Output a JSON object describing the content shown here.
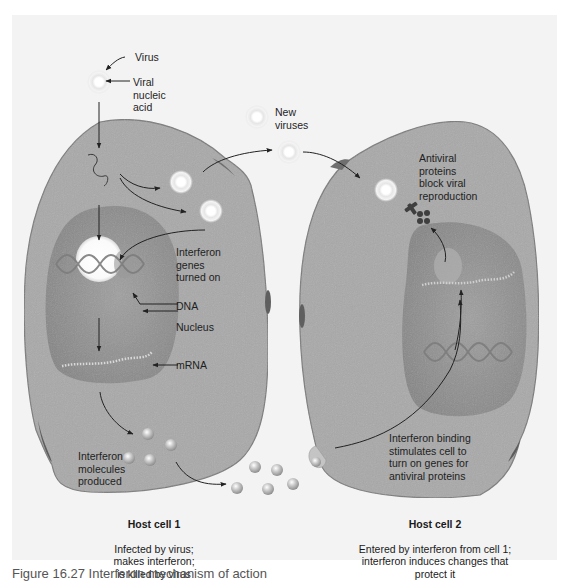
{
  "figure": {
    "background": "#f3f3f3",
    "colors": {
      "cytoplasm": "#a9a9a9",
      "cell_outline": "#7a7a7a",
      "nucleus": "#8b8b8b",
      "highlight": "#ffffff",
      "interferon_sphere": "#b8b8b8",
      "arrow": "#222222"
    },
    "caption": "Figure 16.27 Interferon mechanism of action"
  },
  "labels": {
    "virus": "Virus",
    "viral_nucleic_acid": "Viral\nnucleic\nacid",
    "new_viruses": "New\nviruses",
    "interferon_genes": "Interferon\ngenes\nturned on",
    "dna": "DNA",
    "nucleus": "Nucleus",
    "mrna": "mRNA",
    "interferon_molecules": "Interferon\nmolecules\nproduced",
    "antiviral_proteins": "Antiviral\nproteins\nblock viral\nreproduction",
    "interferon_binding": "Interferon binding\nstimulates cell to\nturn on genes for\nantiviral proteins"
  },
  "cells": [
    {
      "title": "Host cell 1",
      "description": "Infected by virus;\nmakes interferon;\nis killed by virus"
    },
    {
      "title": "Host cell 2",
      "description": "Entered by interferon from cell 1;\ninterferon induces changes that\nprotect it"
    }
  ]
}
